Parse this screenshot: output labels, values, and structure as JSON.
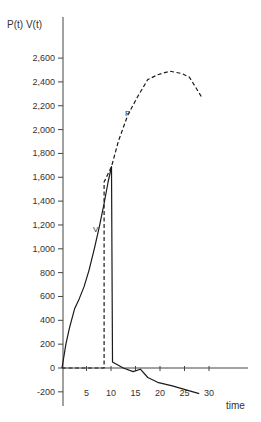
{
  "chart_data": {
    "type": "line",
    "title": "",
    "ylabel": "P(t) V(t)",
    "xlabel": "time",
    "xlim": [
      0,
      38
    ],
    "ylim": [
      -300,
      2900
    ],
    "grid": false,
    "legend": "inline labels",
    "x_ticks": [
      5,
      10,
      15,
      20,
      25,
      30
    ],
    "x_tick_labels": [
      "5",
      "10",
      "15",
      "20",
      "25",
      "30"
    ],
    "y_ticks": [
      -200,
      0,
      200,
      400,
      600,
      800,
      1000,
      1200,
      1400,
      1600,
      1800,
      2000,
      2200,
      2400,
      2600
    ],
    "y_tick_labels": [
      "-200",
      "0",
      "200",
      "400",
      "600",
      "800",
      "1,000",
      "1,200",
      "1,400",
      "1,600",
      "1,800",
      "2,000",
      "2,200",
      "2,400",
      "2,600"
    ],
    "series": [
      {
        "name": "V",
        "style": "solid",
        "label_text": "V",
        "points": [
          [
            0,
            0
          ],
          [
            0.8,
            200
          ],
          [
            1.5,
            330
          ],
          [
            2.6,
            500
          ],
          [
            3.5,
            580
          ],
          [
            4.5,
            680
          ],
          [
            5.5,
            820
          ],
          [
            6.6,
            1000
          ],
          [
            7.6,
            1180
          ],
          [
            8.6,
            1380
          ],
          [
            9.4,
            1560
          ],
          [
            10.1,
            1690
          ],
          [
            10.3,
            50
          ],
          [
            12.5,
            0
          ],
          [
            14.5,
            -30
          ],
          [
            16,
            -10
          ],
          [
            17.5,
            -80
          ],
          [
            19.5,
            -120
          ],
          [
            22.5,
            -150
          ],
          [
            25.5,
            -185
          ],
          [
            28,
            -215
          ]
        ]
      },
      {
        "name": "P",
        "style": "dashed",
        "label_text": "P",
        "points": [
          [
            0,
            0
          ],
          [
            8.6,
            0
          ],
          [
            8.6,
            1560
          ],
          [
            10.1,
            1690
          ],
          [
            11.5,
            1900
          ],
          [
            13.4,
            2120
          ],
          [
            15.5,
            2280
          ],
          [
            17.5,
            2420
          ],
          [
            19.5,
            2460
          ],
          [
            22,
            2490
          ],
          [
            24.5,
            2470
          ],
          [
            26,
            2440
          ],
          [
            28.7,
            2260
          ]
        ]
      }
    ]
  },
  "axes": {
    "y_title": "P(t) V(t)",
    "x_title": "time"
  }
}
